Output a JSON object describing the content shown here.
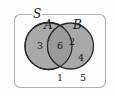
{
  "diagram": {
    "type": "venn-2-set",
    "universe": {
      "label": "S",
      "name": "universal-set"
    },
    "sets": [
      {
        "id": "A",
        "label": "A",
        "name": "set-a"
      },
      {
        "id": "B",
        "label": "B",
        "name": "set-b"
      }
    ],
    "regions": [
      {
        "id": "A-only",
        "label": "3",
        "description": "in A only"
      },
      {
        "id": "A-and-B",
        "label": "6",
        "description": "intersection of A and B"
      },
      {
        "id": "B-only-upper",
        "label": "2",
        "description": "in B only, upper"
      },
      {
        "id": "B-only-lower",
        "label": "4",
        "description": "in B only, lower"
      },
      {
        "id": "outside-left",
        "label": "1",
        "description": "in S, outside A and B"
      },
      {
        "id": "outside-right",
        "label": "5",
        "description": "in S, outside A and B"
      }
    ],
    "colors": {
      "circle_fill": "#a9a9a9",
      "intersection_fill": "#9a9a9a",
      "circle_stroke": "#2b2b2b",
      "frame_stroke": "#b3b3b3",
      "background": "#fdfdfd",
      "text": "#1a1a1a"
    }
  }
}
